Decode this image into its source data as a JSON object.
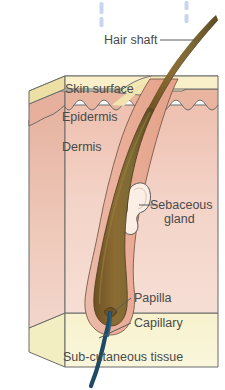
{
  "diagram": {
    "type": "anatomical-cross-section",
    "labels": {
      "hair_shaft": "Hair shaft",
      "skin_surface": "Skin surface",
      "epidermis": "Epidermis",
      "dermis": "Dermis",
      "sebaceous_gland_line1": "Sebaceous",
      "sebaceous_gland_line2": "gland",
      "papilla": "Papilla",
      "capillary": "Capillary",
      "subcutaneous_tissue": "Sub-cutaneous tissue"
    },
    "colors": {
      "background": "#ffffff",
      "skin_surface": "#f7eec4",
      "skin_surface_side": "#efe0a8",
      "epidermis": "#edbaa6",
      "epidermis_side": "#e2a891",
      "dermis": "#f3d2c6",
      "dermis_side": "#eec3b4",
      "subcutaneous": "#f7f1c9",
      "subcutaneous_side": "#efe8b4",
      "hair_shaft": "#7a5c2e",
      "hair_shaft_light": "#a78a4e",
      "follicle_sheath": "#e8b09a",
      "sebaceous_gland_fill": "#fbece2",
      "capillary": "#1f4a63",
      "outline": "#6b6b6b",
      "label_text": "#4a4a4a",
      "tick_marks": "#ccd7f0"
    },
    "tick_marks": [
      {
        "x": 101,
        "segments": [
          [
            2,
            13
          ],
          [
            17,
            26
          ]
        ]
      },
      {
        "x": 186,
        "segments": [
          [
            1,
            10
          ],
          [
            14,
            22
          ]
        ]
      }
    ]
  }
}
